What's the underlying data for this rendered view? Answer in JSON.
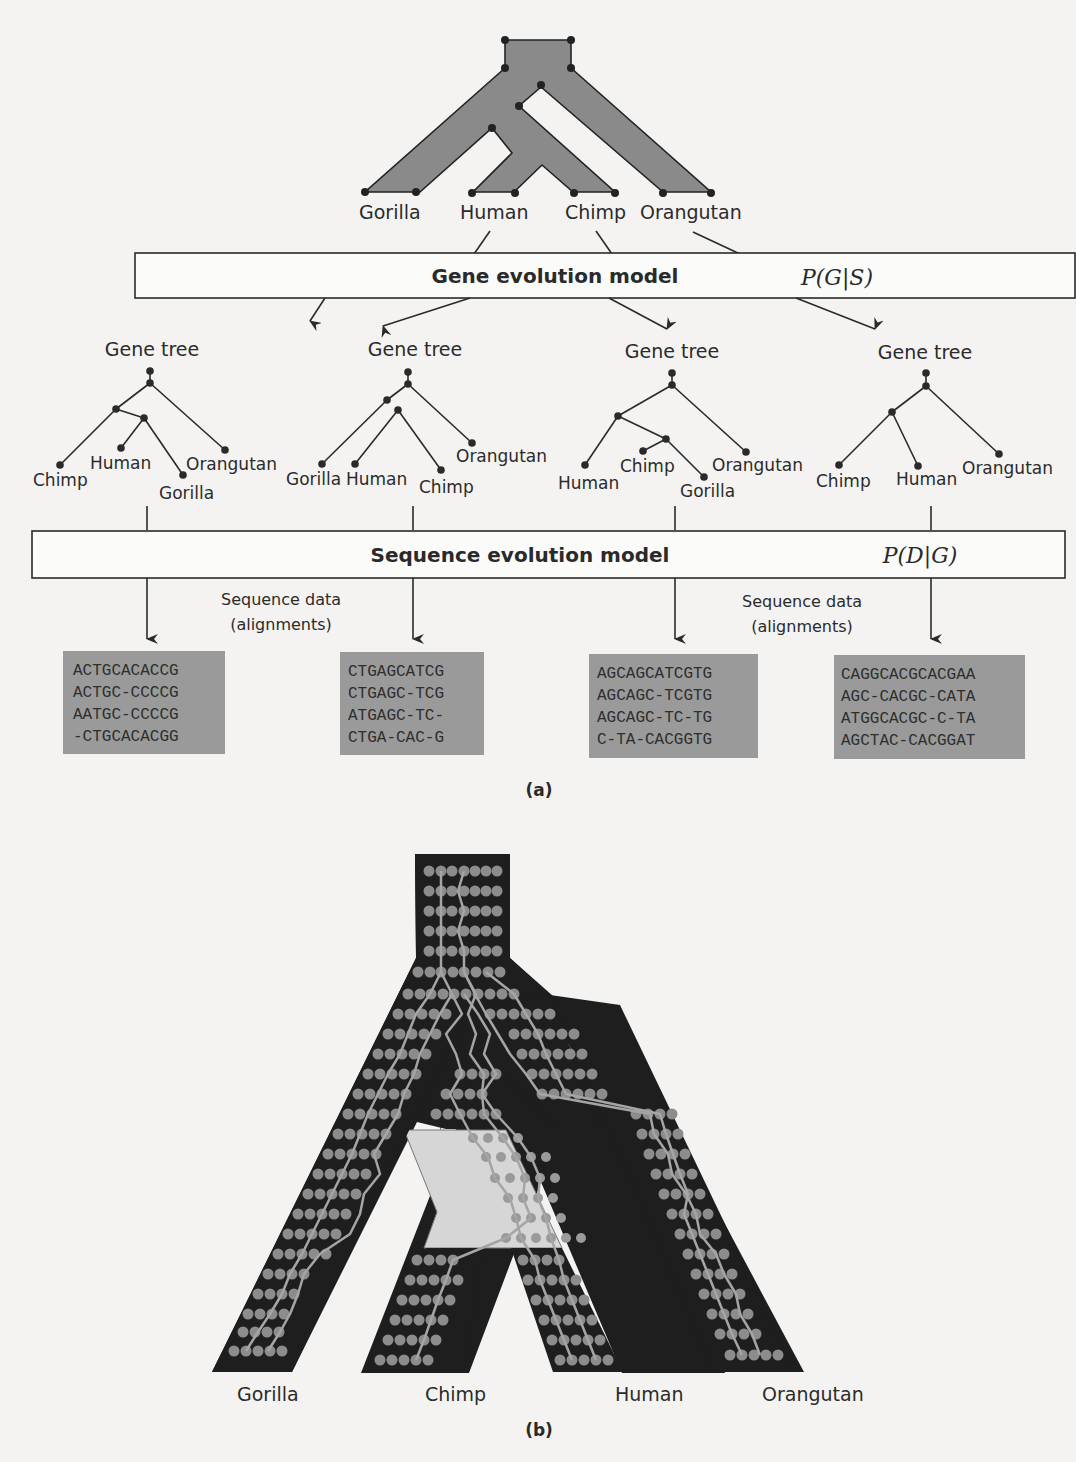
{
  "panel_a": {
    "caption": "(a)",
    "species_tree": {
      "taxa": [
        "Gorilla",
        "Human",
        "Chimp",
        "Orangutan"
      ]
    },
    "gene_model": {
      "label": "Gene evolution model",
      "probability": "P(G|S)"
    },
    "gene_trees": [
      {
        "title": "Gene tree",
        "leaves": [
          "Chimp",
          "Human",
          "Gorilla",
          "Orangutan"
        ]
      },
      {
        "title": "Gene tree",
        "leaves": [
          "Gorilla",
          "Human",
          "Chimp",
          "Orangutan"
        ]
      },
      {
        "title": "Gene tree",
        "leaves": [
          "Human",
          "Chimp",
          "Gorilla",
          "Orangutan"
        ]
      },
      {
        "title": "Gene tree",
        "leaves": [
          "Chimp",
          "Human",
          "Orangutan"
        ]
      }
    ],
    "sequence_model": {
      "label": "Sequence evolution model",
      "probability": "P(D|G)"
    },
    "sequence_data_labels": [
      {
        "line1": "Sequence data",
        "line2": "(alignments)"
      },
      {
        "line1": "Sequence data",
        "line2": "(alignments)"
      }
    ],
    "alignments": [
      [
        "ACTGCACACCG",
        "ACTGC-CCCCG",
        "AATGC-CCCCG",
        "-CTGCACACGG"
      ],
      [
        "CTGAGCATCG",
        "CTGAGC-TCG",
        "ATGAGC-TC-",
        "CTGA-CAC-G"
      ],
      [
        "AGCAGCATCGTG",
        "AGCAGC-TCGTG",
        "AGCAGC-TC-TG",
        "C-TA-CACGGTG"
      ],
      [
        "CAGGCACGCACGAA",
        "AGC-CACGC-CATA",
        "ATGGCACGC-C-TA",
        "AGCTAC-CACGGAT"
      ]
    ]
  },
  "panel_b": {
    "caption": "(b)",
    "taxa": [
      "Gorilla",
      "Chimp",
      "Human",
      "Orangutan"
    ]
  },
  "colors": {
    "tree_fill": "#8a8a8a",
    "alignment_fill": "#9a9a9a",
    "pop_tree_fill": "#1e1e1e",
    "dot": "#8c8c8c",
    "highlight": "#d6d6d6",
    "background": "#f4f3f1"
  }
}
